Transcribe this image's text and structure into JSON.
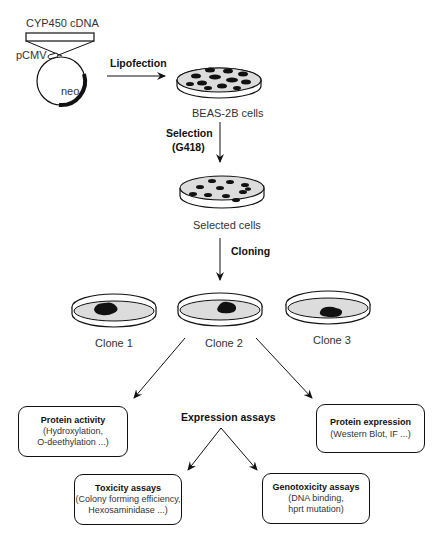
{
  "plasmid": {
    "insert_label": "CYP450  cDNA",
    "promoter_label": "pCMV",
    "marker_label": "neo"
  },
  "steps": {
    "lipofection": "Lipofection",
    "selection_line1": "Selection",
    "selection_line2": "(G418)",
    "cloning": "Cloning"
  },
  "dishes": {
    "beas": "BEAS-2B cells",
    "selected": "Selected cells",
    "clone1": "Clone 1",
    "clone2": "Clone 2",
    "clone3": "Clone 3"
  },
  "assays": {
    "center_label": "Expression assays",
    "protein_activity": {
      "title": "Protein activity",
      "line1": "(Hydroxylation,",
      "line2": "O-deethylation ...)"
    },
    "protein_expression": {
      "title": "Protein expression",
      "line1": "(Western Blot, IF ...)"
    },
    "toxicity": {
      "title": "Toxicity assays",
      "line1": "(Colony forming efficiency,",
      "line2": "Hexosaminidase ...)"
    },
    "genotoxicity": {
      "title": "Genotoxicity assays",
      "line1": "(DNA binding,",
      "line2": "hprt mutation)"
    }
  },
  "colors": {
    "line": "#111111",
    "dish_fill": "#dcdcdc",
    "cells": "#111111"
  }
}
